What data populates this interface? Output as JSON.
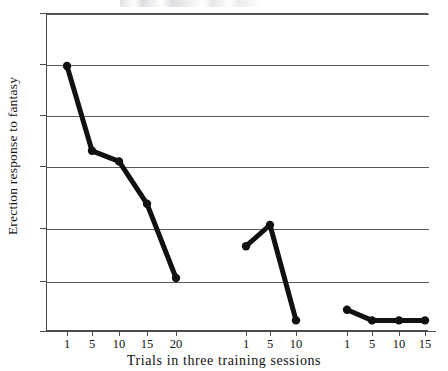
{
  "chart_data": {
    "type": "line",
    "title": "",
    "xlabel": "Trials in three training sessions",
    "ylabel": "Erection response to fantasy",
    "ylim": [
      0,
      30
    ],
    "yticks": [
      0,
      5,
      10,
      15,
      20,
      25,
      30
    ],
    "ytick_labels": [
      "0",
      "5",
      "10",
      "15",
      "20",
      "25",
      "30"
    ],
    "grid": true,
    "grid_axis": "y",
    "legend": "none",
    "marker": "filled-circle",
    "line_color": "#111111",
    "marker_color": "#111111",
    "grid_color": "#5a5a5a",
    "axis_color": "#4a4a4a",
    "background_color": "#ffffff",
    "series": [
      {
        "name": "Session 1",
        "x": [
          1,
          5,
          10,
          15,
          20
        ],
        "xtick_labels": [
          "1",
          "5",
          "10",
          "15",
          "20"
        ],
        "values": [
          25,
          17,
          16,
          12,
          5
        ]
      },
      {
        "name": "Session 2",
        "x": [
          1,
          5,
          10
        ],
        "xtick_labels": [
          "1",
          "5",
          "10"
        ],
        "values": [
          8,
          10,
          1
        ]
      },
      {
        "name": "Session 3",
        "x": [
          1,
          5,
          10,
          15
        ],
        "xtick_labels": [
          "1",
          "5",
          "10",
          "15"
        ],
        "values": [
          2,
          1,
          1,
          1
        ]
      }
    ]
  },
  "axis": {
    "y": {
      "label": "Erection response to fantasy",
      "ticks": [
        {
          "value": "30"
        },
        {
          "value": "25"
        },
        {
          "value": "20"
        },
        {
          "value": "15"
        },
        {
          "value": "10"
        },
        {
          "value": "5"
        },
        {
          "value": "0"
        }
      ]
    },
    "x": {
      "label": "Trials in three training sessions",
      "ticks": [
        {
          "value": "1"
        },
        {
          "value": "5"
        },
        {
          "value": "10"
        },
        {
          "value": "15"
        },
        {
          "value": "20"
        },
        {
          "value": "1"
        },
        {
          "value": "5"
        },
        {
          "value": "10"
        },
        {
          "value": "1"
        },
        {
          "value": "5"
        },
        {
          "value": "10"
        },
        {
          "value": "15"
        }
      ]
    }
  }
}
